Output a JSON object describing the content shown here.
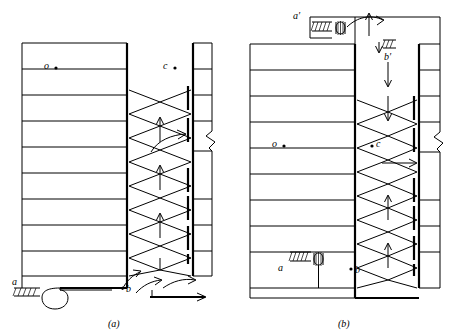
{
  "figure": {
    "title_a": "(a)",
    "title_b": "(b)",
    "labels_a": [
      {
        "id": "o",
        "text": "o"
      },
      {
        "id": "c",
        "text": "c"
      },
      {
        "id": "a",
        "text": "a"
      },
      {
        "id": "b",
        "text": "b"
      }
    ],
    "labels_b": [
      {
        "id": "a_prime_top",
        "text": "a′"
      },
      {
        "id": "b_prime",
        "text": "b′"
      },
      {
        "id": "o",
        "text": "o"
      },
      {
        "id": "c",
        "text": "c"
      },
      {
        "id": "a",
        "text": "a"
      },
      {
        "id": "b",
        "text": "b"
      }
    ],
    "colors": {
      "stroke": "#000000",
      "background": "#ffffff"
    },
    "panel_a": {
      "tray_rows": 9,
      "caption": "(a)"
    },
    "panel_b": {
      "tray_rows": 9,
      "caption": "(b)"
    }
  }
}
